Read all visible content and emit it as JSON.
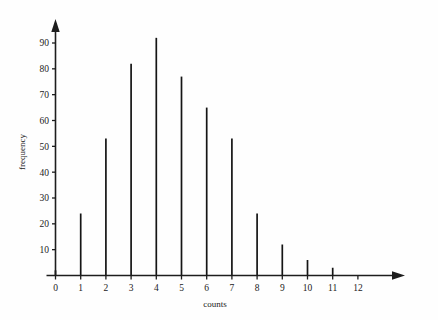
{
  "chart_data": {
    "type": "bar",
    "title": "",
    "subtitle": "",
    "xlabel": "counts",
    "ylabel": "frequency",
    "categories": [
      0,
      1,
      2,
      3,
      4,
      5,
      6,
      7,
      8,
      9,
      10,
      11,
      12
    ],
    "values": [
      2,
      24,
      53,
      82,
      92,
      77,
      65,
      53,
      24,
      12,
      6,
      3,
      0
    ],
    "x_tick_labels": [
      "0",
      "1",
      "2",
      "3",
      "4",
      "5",
      "6",
      "7",
      "8",
      "9",
      "10",
      "11",
      "12"
    ],
    "y_tick_labels": [
      "10",
      "20",
      "30",
      "40",
      "50",
      "60",
      "70",
      "80",
      "90"
    ],
    "y_tick_values": [
      10,
      20,
      30,
      40,
      50,
      60,
      70,
      80,
      90
    ],
    "xlim": [
      -0.6,
      13.2
    ],
    "ylim": [
      0,
      97
    ],
    "grid": false,
    "legend": null,
    "legend_position": "none",
    "style": "needle-spike",
    "axis_arrows": {
      "x": "right-arrowhead",
      "y": "up-arrowhead"
    },
    "series_color": "#151515",
    "axis_color": "#1d1d1d",
    "background_color": "#fefefe"
  },
  "figure": {
    "x_axis_name": "counts-axis",
    "y_axis_name": "frequency-axis"
  }
}
